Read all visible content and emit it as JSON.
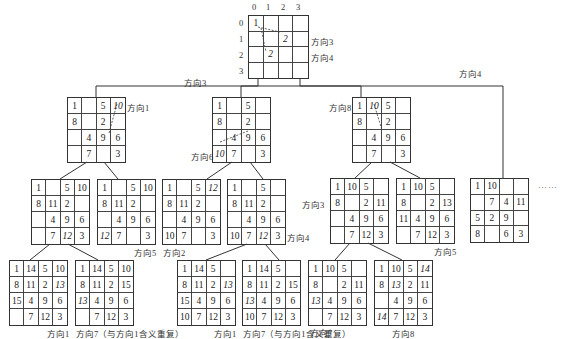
{
  "root": {
    "col_labels": [
      "0",
      "1",
      "2",
      "3"
    ],
    "row_labels": [
      "0",
      "1",
      "2",
      "3"
    ],
    "cells": [
      "1",
      "",
      "",
      "",
      "",
      "",
      "2",
      "",
      "",
      "2",
      "",
      "",
      "",
      "",
      "",
      ""
    ],
    "italic": [
      6,
      9
    ],
    "labels": [
      "方向3",
      "方向4"
    ]
  },
  "edge_labels": {
    "left": "方向3",
    "right": "方向4"
  },
  "nodes": [
    {
      "id": "L1A",
      "cells": [
        "1",
        "",
        "5",
        "10",
        "8",
        "",
        "2",
        "",
        "",
        "4",
        "9",
        "6",
        "",
        "7",
        "",
        "3"
      ],
      "italic": [
        3
      ],
      "label": "方向1"
    },
    {
      "id": "L1B",
      "cells": [
        "1",
        "",
        "5",
        "",
        "8",
        "",
        "2",
        "",
        "",
        "4",
        "9",
        "6",
        "10",
        "7",
        "",
        "3"
      ],
      "italic": [
        12
      ],
      "label": "方向6"
    },
    {
      "id": "L1C",
      "cells": [
        "1",
        "10",
        "5",
        "",
        "8",
        "",
        "2",
        "",
        "",
        "4",
        "9",
        "6",
        "",
        "7",
        "",
        "3"
      ],
      "italic": [
        1
      ],
      "label": "方向8"
    },
    {
      "id": "L1D",
      "cells": [
        "1",
        "10",
        "",
        "",
        "",
        "7",
        "4",
        "11",
        "5",
        "2",
        "9",
        "",
        "8",
        "",
        "6",
        "3"
      ],
      "italic": [],
      "label": ""
    },
    {
      "id": "L2A1",
      "cells": [
        "1",
        "",
        "5",
        "10",
        "8",
        "11",
        "2",
        "",
        "",
        "4",
        "9",
        "6",
        "",
        "7",
        "12",
        "3"
      ],
      "italic": [
        14
      ],
      "label": ""
    },
    {
      "id": "L2A2",
      "cells": [
        "1",
        "",
        "5",
        "10",
        "8",
        "11",
        "2",
        "",
        "",
        "4",
        "9",
        "6",
        "12",
        "7",
        "",
        "3"
      ],
      "italic": [
        12
      ],
      "label": "方向5"
    },
    {
      "id": "L2B1",
      "cells": [
        "1",
        "",
        "5",
        "12",
        "8",
        "11",
        "2",
        "",
        "",
        "4",
        "9",
        "6",
        "10",
        "7",
        "",
        "3"
      ],
      "italic": [
        3
      ],
      "label": "方向2"
    },
    {
      "id": "L2B2",
      "cells": [
        "1",
        "",
        "5",
        "",
        "8",
        "11",
        "2",
        "",
        "",
        "4",
        "9",
        "6",
        "10",
        "7",
        "12",
        "3"
      ],
      "italic": [
        14
      ],
      "label": "方向4"
    },
    {
      "id": "L2C1",
      "cells": [
        "1",
        "10",
        "5",
        "",
        "8",
        "",
        "2",
        "11",
        "",
        "4",
        "9",
        "6",
        "",
        "7",
        "12",
        "3"
      ],
      "italic": [],
      "label": "方向3"
    },
    {
      "id": "L2C2",
      "cells": [
        "1",
        "10",
        "5",
        "",
        "8",
        "",
        "2",
        "13",
        "11",
        "4",
        "9",
        "6",
        "",
        "7",
        "12",
        "3"
      ],
      "italic": [],
      "label": "方向5"
    },
    {
      "id": "L3A",
      "cells": [
        "1",
        "14",
        "5",
        "10",
        "8",
        "11",
        "2",
        "13",
        "15",
        "4",
        "9",
        "6",
        "",
        "7",
        "12",
        "3"
      ],
      "italic": [
        7
      ],
      "label": "方向1"
    },
    {
      "id": "L3B",
      "cells": [
        "1",
        "14",
        "5",
        "10",
        "8",
        "11",
        "2",
        "15",
        "13",
        "4",
        "9",
        "6",
        "",
        "7",
        "12",
        "3"
      ],
      "italic": [
        8
      ],
      "label": "方向7（与方向1含义重复）"
    },
    {
      "id": "L3C",
      "cells": [
        "1",
        "14",
        "5",
        "",
        "8",
        "11",
        "2",
        "13",
        "15",
        "4",
        "9",
        "6",
        "10",
        "7",
        "12",
        "3"
      ],
      "italic": [
        7
      ],
      "label": "方向1"
    },
    {
      "id": "L3D",
      "cells": [
        "1",
        "14",
        "5",
        "",
        "8",
        "11",
        "2",
        "15",
        "13",
        "4",
        "9",
        "6",
        "10",
        "7",
        "12",
        "3"
      ],
      "italic": [
        8
      ],
      "label": "方向7（与方向1含义重复）"
    },
    {
      "id": "L3E",
      "cells": [
        "1",
        "10",
        "5",
        "",
        "8",
        "",
        "2",
        "11",
        "13",
        "4",
        "9",
        "6",
        "",
        "7",
        "12",
        "3"
      ],
      "italic": [
        8
      ],
      "label": "方向7"
    },
    {
      "id": "L3F",
      "cells": [
        "1",
        "10",
        "5",
        "14",
        "8",
        "13",
        "2",
        "11",
        "",
        "4",
        "9",
        "6",
        "14",
        "7",
        "12",
        "3"
      ],
      "italic": [
        3,
        5,
        12
      ],
      "label": "方向8"
    }
  ],
  "more_indicator": "……"
}
